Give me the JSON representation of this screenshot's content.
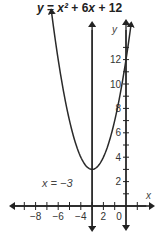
{
  "chart_data": {
    "type": "line",
    "title": "y = x² + 6x + 12",
    "xlabel": "x",
    "ylabel": "y",
    "xlim": [
      -9.5,
      1.8
    ],
    "ylim": [
      -1.5,
      15
    ],
    "x_ticks": [
      -8,
      -6,
      -4,
      -2,
      0
    ],
    "x_tick_labels": [
      "−8",
      "−6",
      "−4",
      "2",
      "0"
    ],
    "y_ticks": [
      2,
      4,
      6,
      8,
      10,
      12
    ],
    "y_tick_labels": [
      "2",
      "4",
      "6",
      "8",
      "10",
      "12"
    ],
    "grid": false,
    "series": [
      {
        "name": "y = x² + 6x + 12",
        "function": "x^2 + 6x + 12",
        "x": [
          -6.6,
          -6,
          -5,
          -4,
          -3,
          -2,
          -1,
          0,
          0.5
        ],
        "values": [
          15,
          12,
          7,
          4,
          3,
          4,
          7,
          12,
          15.25
        ]
      }
    ],
    "annotations": [
      {
        "text": "x = −3",
        "type": "vertical-line",
        "x": -3,
        "label": "axis of symmetry"
      }
    ],
    "vertex": [
      -3,
      3
    ]
  },
  "labels": {
    "title_y": "y",
    "title_eq": "=",
    "title_x2": "x²",
    "title_rest": "+ 6",
    "title_x": "x",
    "title_end": "+ 12",
    "x_axis": "x",
    "y_axis": "y",
    "symmetry_label": "x  =  −3",
    "origin": "0"
  }
}
